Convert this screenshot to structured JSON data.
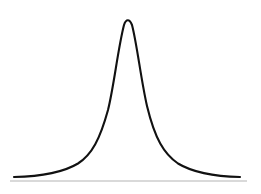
{
  "figure": {
    "width": 261,
    "height": 194,
    "background_color": "#ffffff",
    "curve_color": "#111111",
    "curve_stroke_width": 2.1,
    "baseline_color": "#b4b4b4",
    "baseline_stroke_width": 1.1,
    "title": "",
    "caption": ""
  },
  "chart_data": {
    "type": "line",
    "title": "",
    "subtitle": "",
    "xlabel": "",
    "ylabel": "",
    "grid": false,
    "legend": null,
    "legend_position": "none",
    "annotations": [],
    "xtick_labels": [],
    "ytick_labels": [],
    "axis_line": {
      "orientation": "horizontal",
      "x_start": 10,
      "x_end": 247,
      "y": 181,
      "color": "#b4b4b4"
    },
    "peak": {
      "x": 127,
      "y": 17
    },
    "xlim": [
      14,
      240
    ],
    "ylim": [
      17,
      177
    ],
    "series": [
      {
        "name": "density",
        "x": [
          14,
          22,
          30,
          38,
          46,
          54,
          62,
          70,
          78,
          86,
          94,
          100,
          106,
          112,
          118,
          122,
          127,
          132,
          136,
          142,
          148,
          154,
          160,
          168,
          176,
          184,
          192,
          200,
          208,
          216,
          224,
          232,
          240
        ],
        "y": [
          177,
          176,
          175,
          174,
          172,
          170,
          167,
          163,
          157,
          148,
          134,
          120,
          100,
          75,
          46,
          29,
          17,
          25,
          38,
          66,
          94,
          116,
          133,
          150,
          160,
          166,
          170,
          172,
          174,
          175,
          176,
          176,
          177
        ]
      }
    ],
    "path_d": "M 14 177 C 40 176.4 62 173.2 78 163.5 C 92 154.5 100 139 108 110 C 114 86 118 48 124 25 C 126 18.6 129.5 18.6 132 25 C 137 44 141 80 147 106 C 155 139 164 154 178 163.5 C 194 173.2 214 176.4 240 177"
  }
}
